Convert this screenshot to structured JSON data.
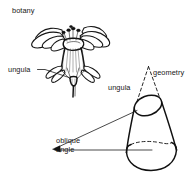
{
  "figure": {
    "title": "ungula",
    "background_color": "#ffffff",
    "ink_color": "#111111",
    "labels": {
      "botany": "botany",
      "ungula_botany": "ungula",
      "geometry": "geometry",
      "ungula_geometry": "ungula",
      "oblique_line1": "oblique",
      "oblique_line2": "angle"
    },
    "panels": [
      {
        "name": "botany-panel",
        "heading": "botany",
        "subject": "flower",
        "callouts": [
          "ungula"
        ]
      },
      {
        "name": "geometry-panel",
        "heading": "geometry",
        "subject": "oblique cone",
        "callouts": [
          "ungula",
          "oblique angle"
        ]
      }
    ]
  }
}
